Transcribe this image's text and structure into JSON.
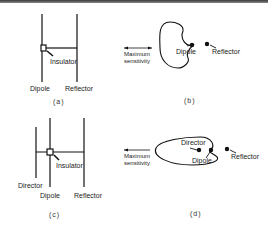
{
  "figure": {
    "panels": [
      {
        "id": "a",
        "caption": "(a)",
        "labels": {
          "element1": "Dipole",
          "element2": "Reflector",
          "insulator": "Insulator"
        }
      },
      {
        "id": "b",
        "caption": "(b)",
        "labels": {
          "direction": "Maximum sensitivity",
          "direction_line1": "Maximum",
          "direction_line2": "sensitivity",
          "dipole": "Dipole",
          "reflector": "Reflector"
        },
        "arrow": "double-headed"
      },
      {
        "id": "c",
        "caption": "(c)",
        "labels": {
          "director": "Director",
          "dipole": "Dipole",
          "reflector": "Reflector",
          "insulator": "Insulator"
        }
      },
      {
        "id": "d",
        "caption": "(d)",
        "labels": {
          "direction_line1": "Maximum",
          "direction_line2": "sensitivity",
          "director": "Director",
          "dipole": "Dipole",
          "reflector": "Reflector"
        },
        "arrow": "left"
      }
    ]
  }
}
